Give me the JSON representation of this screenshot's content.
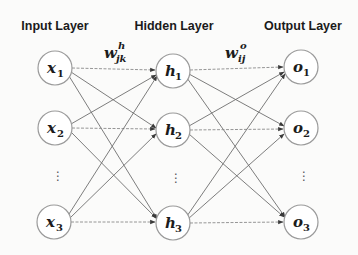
{
  "diagram": {
    "type": "feedforward-neural-network",
    "layers": [
      {
        "title": "Input Layer",
        "nodes": [
          {
            "base": "x",
            "sub": "1"
          },
          {
            "base": "x",
            "sub": "2"
          },
          {
            "base": "x",
            "sub": "3"
          }
        ],
        "ellipsis": "⋮"
      },
      {
        "title": "Hidden Layer",
        "nodes": [
          {
            "base": "h",
            "sub": "1"
          },
          {
            "base": "h",
            "sub": "2"
          },
          {
            "base": "h",
            "sub": "3"
          }
        ],
        "ellipsis": "⋮"
      },
      {
        "title": "Output Layer",
        "nodes": [
          {
            "base": "o",
            "sub": "1"
          },
          {
            "base": "o",
            "sub": "2"
          },
          {
            "base": "o",
            "sub": "3"
          }
        ],
        "ellipsis": "⋮"
      }
    ],
    "weights": {
      "input_to_hidden": {
        "base": "w",
        "sup": "h",
        "sub": "jk"
      },
      "hidden_to_output": {
        "base": "w",
        "sup": "o",
        "sub": "ij"
      }
    },
    "connections": "fully-connected",
    "colors": {
      "background": "#fbfbfa",
      "node_stroke": "#9a9a9a",
      "edge": "#6e6e6e",
      "text": "#1a1a1a"
    }
  }
}
